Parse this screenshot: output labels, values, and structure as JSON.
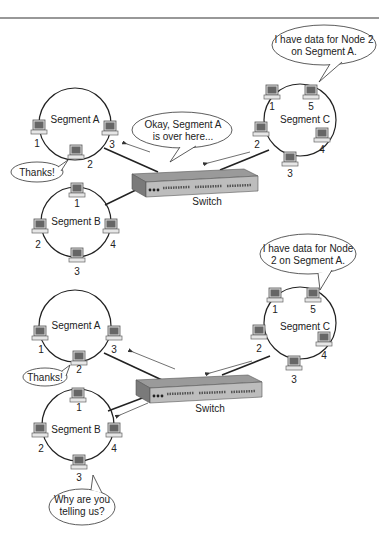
{
  "panels": [
    {
      "segments": {
        "A": {
          "label": "Segment A",
          "nodes": [
            "1",
            "2",
            "3"
          ]
        },
        "B": {
          "label": "Segment B",
          "nodes": [
            "1",
            "2",
            "3",
            "4"
          ]
        },
        "C": {
          "label": "Segment C",
          "nodes": [
            "1",
            "2",
            "3",
            "4",
            "5"
          ]
        }
      },
      "switch_label": "Switch",
      "bubbles": {
        "nodeC5": [
          "I have data for Node 2",
          "on Segment A."
        ],
        "switch": [
          "Okay, Segment A",
          "is over here..."
        ],
        "nodeA2": [
          "Thanks!"
        ]
      }
    },
    {
      "segments": {
        "A": {
          "label": "Segment A",
          "nodes": [
            "1",
            "2",
            "3"
          ]
        },
        "B": {
          "label": "Segment B",
          "nodes": [
            "1",
            "2",
            "3",
            "4"
          ]
        },
        "C": {
          "label": "Segment C",
          "nodes": [
            "1",
            "2",
            "3",
            "4",
            "5"
          ]
        }
      },
      "switch_label": "Switch",
      "bubbles": {
        "nodeC5": [
          "I have data for Node",
          "2 on Segment A."
        ],
        "nodeA2": [
          "Thanks!"
        ],
        "nodeB3": [
          "Why are you",
          "telling us?"
        ]
      }
    }
  ]
}
